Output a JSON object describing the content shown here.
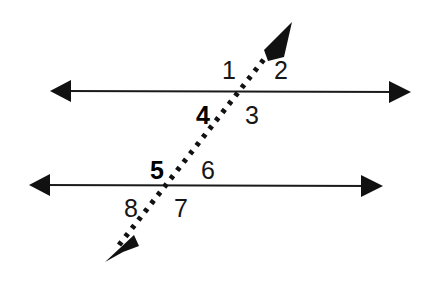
{
  "figure": {
    "name": "parallel-lines-transversal-angles",
    "background_color": "#ffffff",
    "stroke_color": "#1a1a1a",
    "bold_label_color": "#000000"
  },
  "lines": [
    {
      "id": "upper-parallel-line",
      "style": "solid",
      "x1": 50,
      "y1": 91,
      "x2": 411,
      "y2": 92,
      "arrow_start": true,
      "arrow_end": true
    },
    {
      "id": "lower-parallel-line",
      "style": "solid",
      "x1": 29,
      "y1": 185,
      "x2": 383,
      "y2": 186,
      "arrow_start": true,
      "arrow_end": true
    },
    {
      "id": "transversal-line",
      "style": "dotted",
      "x1": 108,
      "y1": 259,
      "x2": 290,
      "y2": 26,
      "arrow_start": true,
      "arrow_end": true
    }
  ],
  "intersections": [
    {
      "id": "upper-intersection",
      "x": 244,
      "y": 91
    },
    {
      "id": "lower-intersection",
      "x": 173,
      "y": 185
    }
  ],
  "angle_labels": [
    {
      "id": "angle-1",
      "text": "1",
      "x": 229,
      "y": 70,
      "weight": "regular"
    },
    {
      "id": "angle-2",
      "text": "2",
      "x": 281,
      "y": 70,
      "weight": "regular"
    },
    {
      "id": "angle-4",
      "text": "4",
      "x": 203,
      "y": 115,
      "weight": "bold"
    },
    {
      "id": "angle-3",
      "text": "3",
      "x": 252,
      "y": 115,
      "weight": "regular"
    },
    {
      "id": "angle-5",
      "text": "5",
      "x": 157,
      "y": 170,
      "weight": "bold"
    },
    {
      "id": "angle-6",
      "text": "6",
      "x": 208,
      "y": 170,
      "weight": "regular"
    },
    {
      "id": "angle-8",
      "text": "8",
      "x": 131,
      "y": 208,
      "weight": "regular"
    },
    {
      "id": "angle-7",
      "text": "7",
      "x": 181,
      "y": 208,
      "weight": "regular"
    }
  ]
}
